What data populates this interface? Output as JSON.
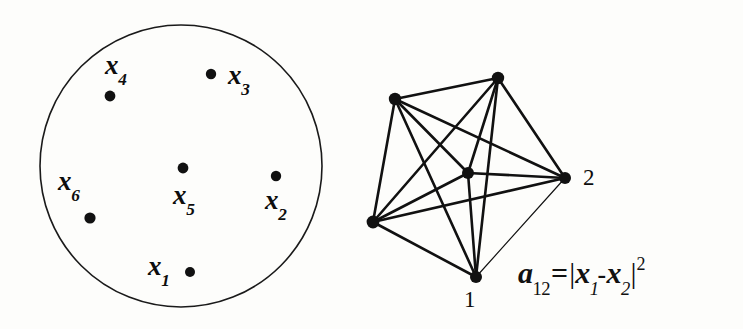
{
  "figure": {
    "background_color": "#fdfdfb",
    "ink_color": "#111111",
    "width": 743,
    "height": 329
  },
  "left_panel": {
    "name": "point-set-disc",
    "circle": {
      "cx": 181,
      "cy": 166,
      "r": 141,
      "stroke": "#1a1a1a",
      "stroke_width": 1.6,
      "fill": "none"
    },
    "points": [
      {
        "id": "x1",
        "label": "x",
        "subscript": "1",
        "dot_x": 190,
        "dot_y": 272,
        "dot_r": 5.0,
        "label_x": 148,
        "label_y": 253
      },
      {
        "id": "x2",
        "label": "x",
        "subscript": "2",
        "dot_x": 276,
        "dot_y": 176,
        "dot_r": 5.2,
        "label_x": 265,
        "label_y": 187
      },
      {
        "id": "x3",
        "label": "x",
        "subscript": "3",
        "dot_x": 211,
        "dot_y": 74,
        "dot_r": 5.2,
        "label_x": 228,
        "label_y": 62
      },
      {
        "id": "x4",
        "label": "x",
        "subscript": "4",
        "dot_x": 110,
        "dot_y": 96,
        "dot_r": 5.4,
        "label_x": 105,
        "label_y": 52
      },
      {
        "id": "x5",
        "label": "x",
        "subscript": "5",
        "dot_x": 183,
        "dot_y": 168,
        "dot_r": 5.4,
        "label_x": 173,
        "label_y": 182
      },
      {
        "id": "x6",
        "label": "x",
        "subscript": "6",
        "dot_x": 90,
        "dot_y": 218,
        "dot_r": 5.6,
        "label_x": 58,
        "label_y": 168
      }
    ]
  },
  "right_panel": {
    "name": "complete-graph-k6",
    "graph_type": "complete",
    "node_count": 6,
    "edge_count": 15,
    "nodes": [
      {
        "id": "n1",
        "x": 476,
        "y": 277,
        "r": 6.0,
        "label": "1",
        "label_x": 464,
        "label_y": 288,
        "label_shown": true
      },
      {
        "id": "n2",
        "x": 565,
        "y": 178,
        "r": 6.0,
        "label": "2",
        "label_x": 583,
        "label_y": 166,
        "label_shown": true
      },
      {
        "id": "n3",
        "x": 498,
        "y": 78,
        "r": 6.2,
        "label": "",
        "label_x": 0,
        "label_y": 0,
        "label_shown": false
      },
      {
        "id": "n4",
        "x": 395,
        "y": 99,
        "r": 6.2,
        "label": "",
        "label_x": 0,
        "label_y": 0,
        "label_shown": false
      },
      {
        "id": "n5",
        "x": 373,
        "y": 222,
        "r": 6.4,
        "label": "",
        "label_x": 0,
        "label_y": 0,
        "label_shown": false
      },
      {
        "id": "n6",
        "x": 468,
        "y": 173,
        "r": 6.0,
        "label": "",
        "label_x": 0,
        "label_y": 0,
        "label_shown": false
      }
    ],
    "edges": [
      {
        "from": "n1",
        "to": "n2",
        "width": 1.2
      },
      {
        "from": "n1",
        "to": "n3",
        "width": 2.6
      },
      {
        "from": "n1",
        "to": "n4",
        "width": 2.6
      },
      {
        "from": "n1",
        "to": "n5",
        "width": 2.6
      },
      {
        "from": "n1",
        "to": "n6",
        "width": 2.6
      },
      {
        "from": "n2",
        "to": "n3",
        "width": 2.6
      },
      {
        "from": "n2",
        "to": "n4",
        "width": 2.6
      },
      {
        "from": "n2",
        "to": "n5",
        "width": 2.6
      },
      {
        "from": "n2",
        "to": "n6",
        "width": 2.6
      },
      {
        "from": "n3",
        "to": "n4",
        "width": 2.6
      },
      {
        "from": "n3",
        "to": "n5",
        "width": 2.6
      },
      {
        "from": "n3",
        "to": "n6",
        "width": 2.6
      },
      {
        "from": "n4",
        "to": "n5",
        "width": 2.6
      },
      {
        "from": "n4",
        "to": "n6",
        "width": 2.6
      },
      {
        "from": "n5",
        "to": "n6",
        "width": 2.6
      }
    ]
  },
  "formula": {
    "name": "edge-weight-formula",
    "plain_text": "a12 = |x1 - x2|^2",
    "parts": {
      "a": "a",
      "a_sub": "12",
      "equals": "=",
      "open_bar": "|",
      "x_first": "x",
      "x_first_sub": "1",
      "minus": "-",
      "x_second": "x",
      "x_second_sub": "2",
      "close_bar": "|",
      "exponent": "2"
    }
  }
}
